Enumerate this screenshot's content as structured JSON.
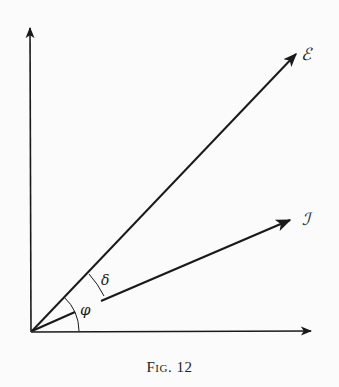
{
  "figure": {
    "caption_prefix": "Fig.",
    "caption_number": "12",
    "labels": {
      "voltage_vector": "ℰ",
      "current_vector": "ℐ",
      "angle_phi": "φ",
      "angle_delta": "δ"
    },
    "colors": {
      "ink": "#1a1a1a",
      "background": "#fbfbfb"
    }
  }
}
